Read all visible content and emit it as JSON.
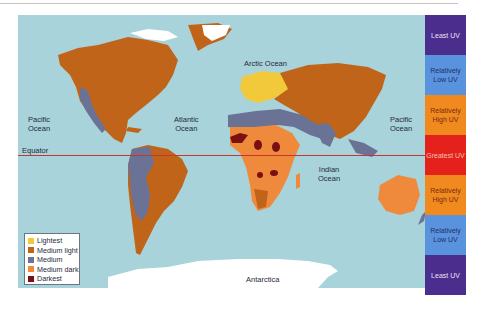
{
  "map": {
    "ocean_labels": {
      "pacific_west": "Pacific\nOcean",
      "atlantic": "Atlantic\nOcean",
      "arctic": "Arctic Ocean",
      "pacific_east": "Pacific\nOcean",
      "indian": "Indian\nOcean"
    },
    "equator_label": "Equator",
    "antarctica_label": "Antarctica",
    "colors": {
      "ocean": "#a9d3da",
      "lightest": "#f2c93a",
      "medium_light": "#c0641a",
      "medium": "#6a7396",
      "medium_dark": "#ef8a3c",
      "darkest": "#7a1012",
      "ice": "#ffffff",
      "equator_line": "#c8342e"
    }
  },
  "legend": {
    "items": [
      {
        "label": "Lightest",
        "color": "#f2c93a"
      },
      {
        "label": "Medium light",
        "color": "#c0641a"
      },
      {
        "label": "Medium",
        "color": "#6a7396"
      },
      {
        "label": "Medium dark",
        "color": "#ef8a3c"
      },
      {
        "label": "Darkest",
        "color": "#7a1012"
      }
    ]
  },
  "uv_scale": {
    "segments": [
      {
        "label": "Least UV",
        "color": "#4a2d8c",
        "text_color": "#e8e4f4"
      },
      {
        "label": "Relatively Low UV",
        "color": "#5a93dd",
        "text_color": "#1e2e6a"
      },
      {
        "label": "Relatively High UV",
        "color": "#f08a1e",
        "text_color": "#7a2a10"
      },
      {
        "label": "Greatest UV",
        "color": "#e4221b",
        "text_color": "#f6c0b0"
      },
      {
        "label": "Relatively High UV",
        "color": "#f08a1e",
        "text_color": "#7a2a10"
      },
      {
        "label": "Relatively Low UV",
        "color": "#5a93dd",
        "text_color": "#1e2e6a"
      },
      {
        "label": "Least UV",
        "color": "#4a2d8c",
        "text_color": "#e8e4f4"
      }
    ]
  }
}
